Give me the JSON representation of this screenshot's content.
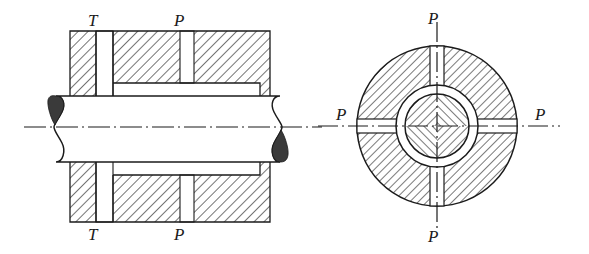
{
  "figure": {
    "background_color": "#ffffff",
    "line_color": "#1b1b1b",
    "hatch_color": "#2a2a2a",
    "fill_color": "#ffffff",
    "break_fill_color": "#3a3a3a",
    "width": 589,
    "height": 254
  },
  "labels": {
    "left_view": {
      "top_torque": "T",
      "top_pressure": "P",
      "bottom_torque": "T",
      "bottom_pressure": "P"
    },
    "right_view": {
      "top": "P",
      "bottom": "P",
      "left": "P",
      "right": "P"
    }
  },
  "label_positions": [
    {
      "name": "left-top-T",
      "text": "T",
      "x": 88,
      "y": 12
    },
    {
      "name": "left-top-P",
      "text": "P",
      "x": 174,
      "y": 12
    },
    {
      "name": "left-bottom-T",
      "text": "T",
      "x": 88,
      "y": 226
    },
    {
      "name": "left-bottom-P",
      "text": "P",
      "x": 174,
      "y": 226
    },
    {
      "name": "right-top-P",
      "text": "P",
      "x": 428,
      "y": 10
    },
    {
      "name": "right-bottom-P",
      "text": "P",
      "x": 428,
      "y": 228
    },
    {
      "name": "right-left-P",
      "text": "P",
      "x": 336,
      "y": 106
    },
    {
      "name": "right-right-P",
      "text": "P",
      "x": 535,
      "y": 106
    }
  ],
  "left_view": {
    "name": "longitudinal-section",
    "housing": {
      "x": 70,
      "y": 31,
      "width": 200,
      "height": 190
    },
    "shaft": {
      "y_top": 96,
      "y_bottom": 162,
      "x_left": 40,
      "x_right": 295
    },
    "centerline": {
      "y": 127,
      "x_start": 24,
      "x_end": 320
    },
    "slots": [
      {
        "name": "torque-slot",
        "x": 96,
        "width": 17
      },
      {
        "name": "pressure-slot",
        "x": 180,
        "width": 14
      }
    ],
    "breaks": [
      {
        "name": "left-shaft-break",
        "side": "left",
        "blob": "upper"
      },
      {
        "name": "right-shaft-break",
        "side": "right",
        "blob": "lower"
      }
    ]
  },
  "right_view": {
    "name": "transverse-section",
    "center": {
      "x": 437,
      "y": 126
    },
    "outer_radius": 80,
    "hub_outer_radius": 41,
    "shaft_radius": 32,
    "slot_half_width": 7,
    "centerlines": {
      "horizontal": {
        "x_start": 318,
        "x_end": 560
      },
      "vertical": {
        "y_start": 22,
        "y_end": 232
      }
    },
    "radial_slots": [
      "top",
      "bottom",
      "left",
      "right"
    ],
    "shaft_quadrant_hatch": "cross-hatched"
  }
}
